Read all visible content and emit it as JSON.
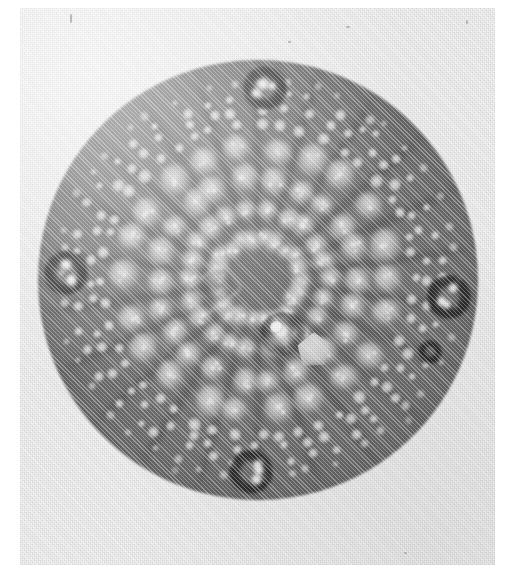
{
  "image": {
    "kind": "photomicrograph",
    "subject": "diatom valve (centric frustule) in plan view",
    "rendering": "grayscale halftone print scan",
    "caption": "",
    "visible_text": "",
    "background_color": "#ffffff",
    "print_color": "#f1f1f1",
    "disc_color": "#6f6f6f",
    "pore_highlight_color": "#e8e8e8",
    "process_color": "#1e1e1e"
  },
  "photo": {
    "left": 20,
    "top": 8,
    "width": 475,
    "height": 557
  },
  "valve": {
    "center_x": 258,
    "center_y": 280,
    "radius": 220,
    "name": "diatom-valve-disc"
  },
  "structures": {
    "central_annulus": {
      "label": "central annulus",
      "x": 245,
      "y": 274
    },
    "central_pore": {
      "label": "central pore",
      "x": 239,
      "y": 267
    },
    "central_plaque": {
      "label": "central hyaline plaque",
      "x": 276,
      "y": 289
    },
    "costa_rectangle": {
      "label": "rectangular costa outline",
      "x": 174,
      "y": 227
    },
    "rimoportula": {
      "label": "rimoportula (small dark ring)",
      "x": 410,
      "y": 344
    }
  },
  "marginal_processes": [
    {
      "name": "process-top",
      "angle_deg": 272,
      "x": 256,
      "y": 96
    },
    {
      "name": "process-left",
      "angle_deg": 182,
      "x": 72,
      "y": 272
    },
    {
      "name": "process-right",
      "angle_deg": 5,
      "x": 444,
      "y": 292
    },
    {
      "name": "process-bottom",
      "angle_deg": 92,
      "x": 262,
      "y": 480
    }
  ],
  "structure_counts": {
    "marginal_processes": 4,
    "radial_stria_rows": 22,
    "areolae_visible": 126,
    "rimoportulae": 1
  },
  "specks": [
    {
      "x": 346,
      "y": 26,
      "w": 4,
      "h": 2
    },
    {
      "x": 288,
      "y": 41,
      "w": 3,
      "h": 2
    },
    {
      "x": 466,
      "y": 20,
      "w": 2,
      "h": 4
    },
    {
      "x": 70,
      "y": 14,
      "w": 2,
      "h": 9
    },
    {
      "x": 404,
      "y": 552,
      "w": 3,
      "h": 2
    }
  ]
}
